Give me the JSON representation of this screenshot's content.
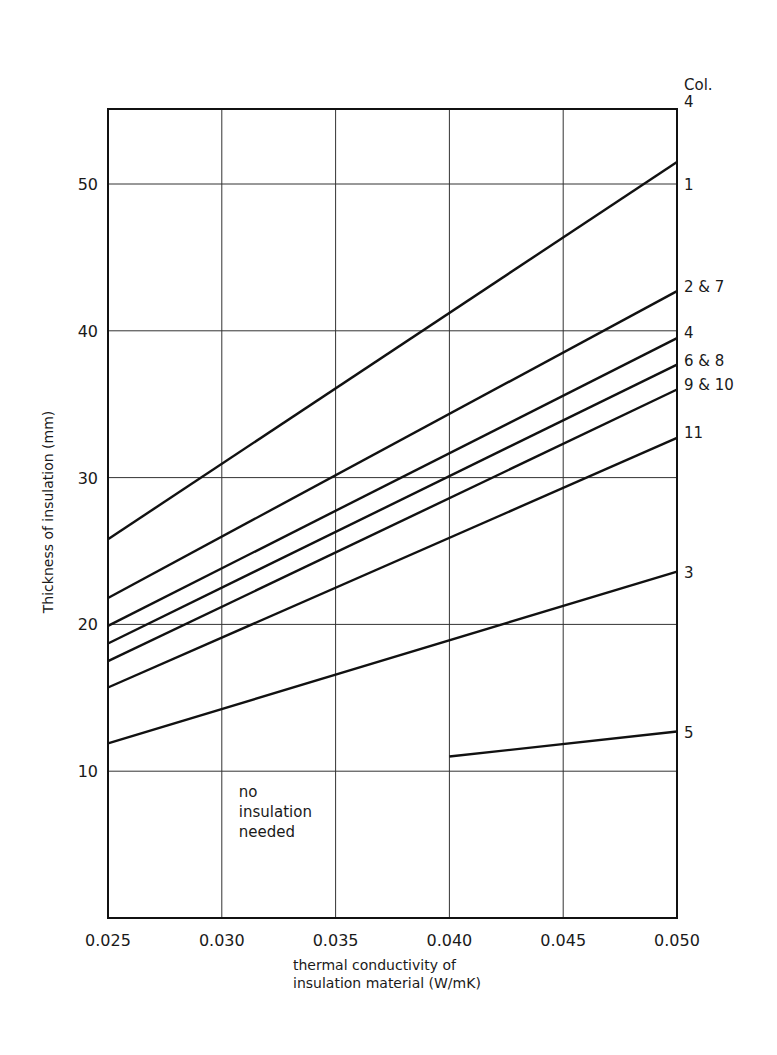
{
  "chart_data": {
    "type": "line",
    "title": "",
    "xlabel": "thermal conductivity of insulation material (W/mK)",
    "xlabel_lines": [
      "thermal conductivity of",
      "insulation material (W/mK)"
    ],
    "ylabel": "Thickness of insulation (mm)",
    "xlim": [
      0.025,
      0.05
    ],
    "ylim": [
      0,
      55
    ],
    "x_ticks": [
      0.025,
      0.03,
      0.035,
      0.04,
      0.045,
      0.05
    ],
    "x_tick_labels": [
      "0.025",
      "0.030",
      "0.035",
      "0.040",
      "0.045",
      "0.050"
    ],
    "y_ticks": [
      10,
      20,
      30,
      40,
      50
    ],
    "y_tick_labels": [
      "10",
      "20",
      "30",
      "40",
      "50"
    ],
    "grid": true,
    "legend_header": "Col.",
    "top_label": "4",
    "series": [
      {
        "name": "1",
        "x": [
          0.025,
          0.05
        ],
        "values": [
          25.8,
          51.5
        ]
      },
      {
        "name": "2 & 7",
        "x": [
          0.025,
          0.05
        ],
        "values": [
          21.8,
          42.7
        ]
      },
      {
        "name": "4",
        "x": [
          0.025,
          0.05
        ],
        "values": [
          19.9,
          39.5
        ]
      },
      {
        "name": "6 & 8",
        "x": [
          0.025,
          0.05
        ],
        "values": [
          18.7,
          37.7
        ]
      },
      {
        "name": "9 & 10",
        "x": [
          0.025,
          0.05
        ],
        "values": [
          17.5,
          36.0
        ]
      },
      {
        "name": "11",
        "x": [
          0.025,
          0.05
        ],
        "values": [
          15.7,
          32.7
        ]
      },
      {
        "name": "3",
        "x": [
          0.025,
          0.05
        ],
        "values": [
          11.9,
          23.6
        ]
      },
      {
        "name": "5",
        "x": [
          0.04,
          0.05
        ],
        "values": [
          11.0,
          12.7
        ]
      }
    ],
    "annotations": [
      {
        "text_lines": [
          "no",
          "insulation",
          "needed"
        ],
        "x": 0.03,
        "y": 9.0
      }
    ]
  },
  "colors": {
    "line": "#111111",
    "grid": "#333333",
    "frame": "#111111"
  }
}
